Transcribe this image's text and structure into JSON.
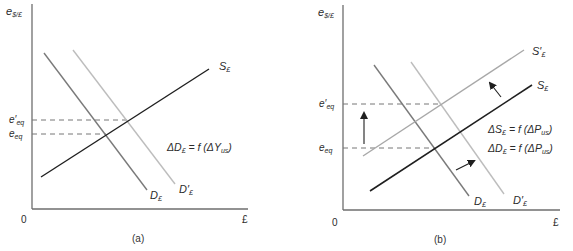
{
  "figure": {
    "colors": {
      "axis": "#6e6e6e",
      "supply": "#1f1f1f",
      "supply_shifted": "#a8a8a8",
      "demand": "#7a7a7a",
      "demand_shifted": "#bdbdbd",
      "dash": "#777777",
      "text": "#2b2b2b"
    },
    "panels": [
      {
        "id": "a",
        "caption": "(a)",
        "y_axis_label": {
          "main": "e",
          "sub": "$/£"
        },
        "x_axis_label": "£",
        "origin_label": "0",
        "levels": [
          {
            "main": "e′",
            "sub": "eq"
          },
          {
            "main": "e",
            "sub": "eq"
          }
        ],
        "curves": {
          "supply": {
            "main": "S",
            "sub": "£"
          },
          "demand": {
            "main": "D",
            "sub": "£"
          },
          "demand_shifted": {
            "main": "D′",
            "sub": "£"
          }
        },
        "equations": [
          {
            "lhs_main": "ΔD",
            "lhs_sub": "£",
            "rhs_main": " = f (ΔY",
            "rhs_sub": "us",
            "rhs_end": ")"
          }
        ]
      },
      {
        "id": "b",
        "caption": "(b)",
        "y_axis_label": {
          "main": "e",
          "sub": "$/£"
        },
        "x_axis_label": "£",
        "origin_label": "0",
        "levels": [
          {
            "main": "e′",
            "sub": "eq"
          },
          {
            "main": "e",
            "sub": "eq"
          }
        ],
        "curves": {
          "supply_shifted": {
            "main": "S′",
            "sub": "£"
          },
          "supply": {
            "main": "S",
            "sub": "£"
          },
          "demand": {
            "main": "D",
            "sub": "£"
          },
          "demand_shifted": {
            "main": "D′",
            "sub": "£"
          }
        },
        "equations": [
          {
            "lhs_main": "ΔS",
            "lhs_sub": "£",
            "rhs_main": " = f (ΔP",
            "rhs_sub": "us",
            "rhs_end": ")"
          },
          {
            "lhs_main": "ΔD",
            "lhs_sub": "£",
            "rhs_main": " = f (ΔP",
            "rhs_sub": "us",
            "rhs_end": ")"
          }
        ]
      }
    ]
  }
}
